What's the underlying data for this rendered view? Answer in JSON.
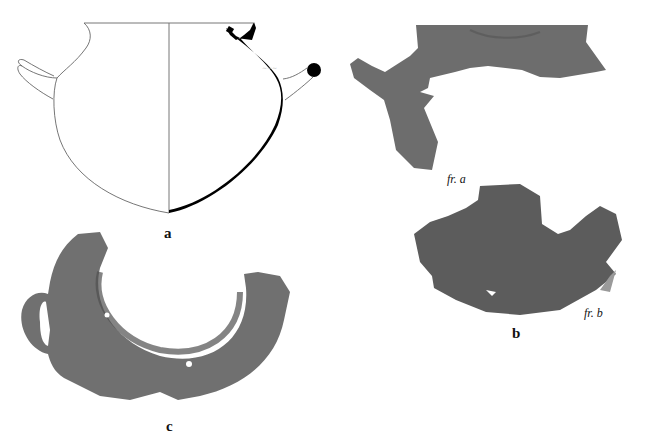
{
  "figure": {
    "panels": [
      {
        "id": "a",
        "label": "a",
        "description": "profile drawing of two-handled jar (section in black)"
      },
      {
        "id": "b",
        "label": "b",
        "description": "photographed sherds",
        "fragments": [
          {
            "label": "fr. a"
          },
          {
            "label": "fr. b"
          }
        ]
      },
      {
        "id": "c",
        "label": "c",
        "description": "photographed rim fragment with handle, viewed from above"
      }
    ],
    "colors": {
      "background": "#ffffff",
      "section": "#000000",
      "outline": "#555555",
      "sherd": "#6e6e6e",
      "sherd_dark": "#555555"
    }
  }
}
